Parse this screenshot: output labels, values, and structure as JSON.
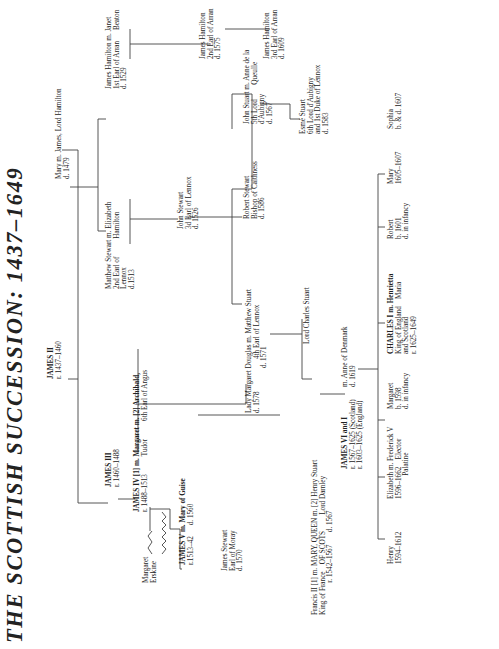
{
  "title": "THE SCOTTISH SUCCESSION: 1437–1649",
  "people": {
    "james2": {
      "name": "JAMES II",
      "dates": "r. 1437–1460"
    },
    "james3": {
      "name": "JAMES III",
      "dates": "r. 1460–1488"
    },
    "mary_hamilton": {
      "line1": "Mary m. James, Lord Hamilton",
      "line2": "d. 1479"
    },
    "james4": {
      "line1": "JAMES IV [1] m. Margaret m. [2] Archibald,",
      "line2": "r. 1488–1513          Tudor          6th Earl of Angus"
    },
    "matthew2": {
      "line1": "Matthew Stewart m. Elizabeth",
      "line2": "2nd Earl of          Hamilton",
      "line3": "Lennox",
      "line4": "d.1513"
    },
    "jhamilton1": {
      "line1": "James Hamilton m. Janet",
      "line2": "1st Earl of Arran      Beaton",
      "line3": "d. 1529"
    },
    "jhamilton2": {
      "line1": "James Hamilton",
      "line2": "2nd Earl of Arran",
      "line3": "d. 1575"
    },
    "jhamilton3": {
      "line1": "James Hamilton",
      "line2": "3rd Earl of Arran",
      "line3": "d. 1609"
    },
    "john3": {
      "line1": "John Stewart",
      "line2": "3d Earl of Lennox",
      "line3": "d. 1526"
    },
    "james5": {
      "line1": "JAMES V m. Mary of Guise",
      "line2": "r.1513–42      d. 1560"
    },
    "margaret_erskine": {
      "line1": "Margaret",
      "line2": "Erskine"
    },
    "james_moray": {
      "line1": "James Stewart",
      "line2": "Earl of Moray",
      "line3": "d. 1570"
    },
    "lady_margaret": {
      "line1": "Lady Margaret Douglas m. Matthew Stuart",
      "line2": "d. 1578                  4th Earl of Lennox",
      "line3": "                         d. 1571"
    },
    "robert_caithness": {
      "line1": "Robert Stewart",
      "line2": "Bishop of Caithness",
      "line3": "d. 1586"
    },
    "john_aubigny": {
      "line1": "John Stuart m. Anne de la",
      "line2": "5th Lord        Queulle",
      "line3": "d'Aubigny",
      "line4": "d. 1567"
    },
    "esme": {
      "line1": "Esmé Stuart",
      "line2": "6th Lord d'Aubigny",
      "line3": "and 1st Duke of Lennox",
      "line4": "d. 1583"
    },
    "mary_qos": {
      "line1": "Francis II [1] m. MARY, QUEEN m. [2] Henry Stuart",
      "line2": "King of France    OF SCOTS         Lord Darnley",
      "line3": "                  r. 1542–1567       d. 1567"
    },
    "charles_stuart": {
      "line1": "Lord Charles Stuart"
    },
    "james6": {
      "line1": "JAMES VI and I",
      "line2": "r. 1567–1625 (Scotland)",
      "line3": "r. 1603–1625 (England)"
    },
    "anne_denmark": {
      "line1": "m. Anne of Denmark",
      "line2": "d. 1619"
    },
    "henry": {
      "line1": "Henry",
      "line2": "1594–1612"
    },
    "elizabeth": {
      "line1": "Elizabeth m. Frederick V",
      "line2": "1596–1662    Elector",
      "line3": "             Palatine"
    },
    "margaret_1598": {
      "line1": "Margaret",
      "line2": "b. 1598",
      "line3": "d. in infancy"
    },
    "charles1": {
      "line1": "CHARLES I m. Henrietta",
      "line2": "King of England    Maria",
      "line3": "and Scotland",
      "line4": "r. 1625–1649"
    },
    "robert_1601": {
      "line1": "Robert",
      "line2": "b. 1601",
      "line3": "d. in infancy"
    },
    "mary_1605": {
      "line1": "Mary",
      "line2": "1605–1607"
    },
    "sophia": {
      "line1": "Sophia",
      "line2": "b. & d. 1607"
    }
  }
}
